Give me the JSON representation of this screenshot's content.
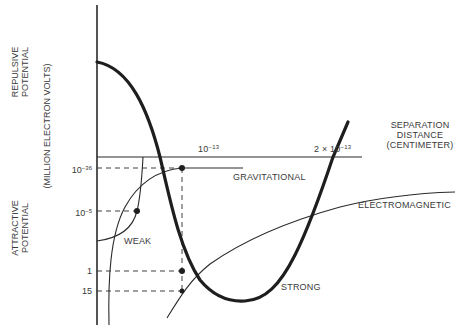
{
  "diagram": {
    "y_axis": {
      "upper_label_line1": "REPULSIVE",
      "upper_label_line2": "POTENTIAL",
      "unit_label": "(MILLION ELECTRON VOLTS)",
      "lower_label_line1": "ATTRACTIVE",
      "lower_label_line2": "POTENTIAL",
      "ticks": [
        {
          "base": "10",
          "exp": "−36"
        },
        {
          "base": "10",
          "exp": "−5"
        },
        {
          "base": "1",
          "exp": ""
        },
        {
          "base": "15",
          "exp": ""
        }
      ]
    },
    "x_axis": {
      "label_line1": "SEPARATION",
      "label_line2": "DISTANCE",
      "label_line3": "(CENTIMETER)",
      "ticks": [
        {
          "base": "10",
          "exp": "−13"
        },
        {
          "base": "2 × 10",
          "exp": "−13"
        }
      ]
    },
    "curves": {
      "gravitational": "GRAVITATIONAL",
      "electromagnetic": "ELECTROMAGNETIC",
      "weak": "WEAK",
      "strong": "STRONG"
    },
    "colors": {
      "ink": "#2a2a2a",
      "background": "#ffffff"
    }
  }
}
